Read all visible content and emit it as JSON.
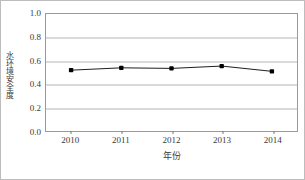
{
  "chart_data": {
    "type": "line",
    "title": "",
    "xlabel": "年份",
    "ylabel": "水环境安全度",
    "categories": [
      "2010",
      "2011",
      "2012",
      "2013",
      "2014"
    ],
    "values": [
      0.52,
      0.54,
      0.535,
      0.555,
      0.51
    ],
    "series": [
      {
        "name": "水环境安全度",
        "values": [
          0.52,
          0.54,
          0.535,
          0.555,
          0.51
        ]
      }
    ],
    "ylim": [
      0.0,
      1.0
    ],
    "ytick_labels": [
      "0.0",
      "0.2",
      "0.4",
      "0.6",
      "0.8",
      "1.0"
    ],
    "ytick_values": [
      0.0,
      0.2,
      0.4,
      0.6,
      0.8,
      1.0
    ],
    "xtick_labels": [
      "2010",
      "2011",
      "2012",
      "2013",
      "2014"
    ],
    "grid": "horizontal",
    "legend": "none",
    "colors": {
      "line": "#1a1a1a",
      "marker": "#000000",
      "grid": "#b5b5b5",
      "axis": "#9a9a9a",
      "text": "#3a3a3a",
      "background": "#ffffff",
      "figure_border": "#bdbdbd"
    }
  }
}
